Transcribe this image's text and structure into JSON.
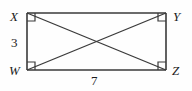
{
  "figure": {
    "kind": "geometry-diagram",
    "shape": "rectangle-with-diagonals",
    "stroke_color": "#3a3a3a",
    "background_color": "#fefefe",
    "vertices": [
      {
        "id": "X",
        "label": "X",
        "position": "top-left",
        "x": 27,
        "y": 13,
        "right_angle": true
      },
      {
        "id": "Y",
        "label": "Y",
        "position": "top-right",
        "x": 166,
        "y": 13,
        "right_angle": true
      },
      {
        "id": "Z",
        "label": "Z",
        "position": "bottom-right",
        "x": 166,
        "y": 70,
        "right_angle": true
      },
      {
        "id": "W",
        "label": "W",
        "position": "bottom-left",
        "x": 27,
        "y": 70,
        "right_angle": true
      }
    ],
    "sides": [
      {
        "from": "X",
        "to": "Y",
        "position": "top"
      },
      {
        "from": "Y",
        "to": "Z",
        "position": "right"
      },
      {
        "from": "W",
        "to": "Z",
        "position": "bottom",
        "measure": "7"
      },
      {
        "from": "X",
        "to": "W",
        "position": "left",
        "measure": "3"
      }
    ],
    "diagonals": [
      {
        "from": "X",
        "to": "Z"
      },
      {
        "from": "W",
        "to": "Y"
      }
    ],
    "measures": {
      "left_side": "3",
      "bottom_side": "7"
    },
    "right_angle_marker_size": 8
  }
}
